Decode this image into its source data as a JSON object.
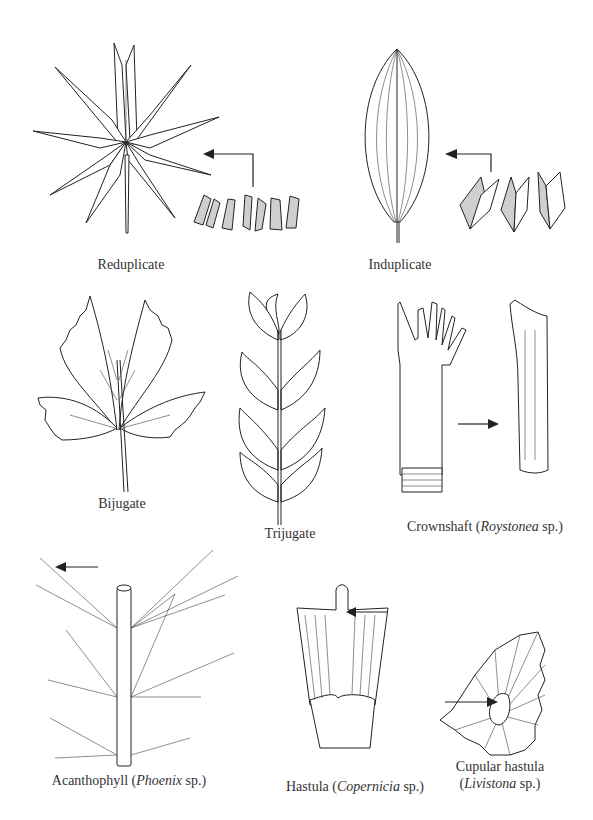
{
  "figure": {
    "panels": [
      {
        "id": "reduplicate",
        "caption": "Reduplicate",
        "icon": "star-shaped-leaf-with-pleats"
      },
      {
        "id": "induplicate",
        "caption": "Induplicate",
        "icon": "lanceolate-leaf-with-folded-segments"
      },
      {
        "id": "bijugate",
        "caption": "Bijugate",
        "icon": "two-pair-leaflet"
      },
      {
        "id": "trijugate",
        "caption": "Trijugate",
        "icon": "three-pair-leaflet"
      },
      {
        "id": "crownshaft",
        "caption_prefix": "Crownshaft (",
        "caption_italic": "Roystonea",
        "caption_suffix": " sp.)",
        "icon": "crownshaft-and-sheath"
      },
      {
        "id": "acanthophyll",
        "caption_prefix": "Acanthophyll (",
        "caption_italic": "Phoenix",
        "caption_suffix": " sp.)",
        "icon": "spiny-rachis"
      },
      {
        "id": "hastula",
        "caption_prefix": "Hastula (",
        "caption_italic": "Copernicia",
        "caption_suffix": " sp.)",
        "icon": "hastula"
      },
      {
        "id": "cupular-hastula",
        "caption_line1": "Cupular hastula",
        "caption_prefix": "(",
        "caption_italic": "Livistona",
        "caption_suffix": " sp.)",
        "icon": "fan-leaf-with-cupular-hastula"
      }
    ]
  }
}
